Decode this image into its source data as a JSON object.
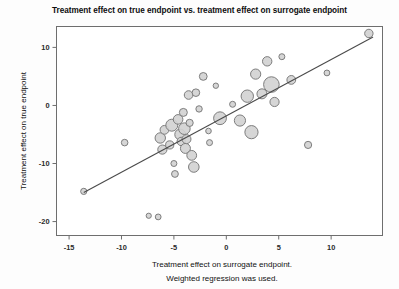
{
  "chart_data": {
    "type": "scatter",
    "title": "Treatment effect on true endpoint vs. treatment effect on surrogate endpoint",
    "xlabel": "Treatment effect on surrogate endpoint.",
    "xlabel_line2": "Weighted regression was used.",
    "ylabel": "Treatment effect on true endpoint",
    "xlim": [
      -16.2,
      14.9
    ],
    "ylim": [
      -22.4,
      13.6
    ],
    "xticks": [
      -15,
      -10,
      -5,
      0,
      5,
      10
    ],
    "xtick_labels": [
      "-15",
      "-10",
      "-5",
      "0",
      "5",
      "10"
    ],
    "yticks": [
      10,
      0,
      -10,
      -20
    ],
    "ytick_labels": [
      "10",
      "0",
      "-10",
      "-20"
    ],
    "grid": false,
    "legend": false,
    "marker": {
      "shape": "circle",
      "fill_color": "#d2d2d2",
      "edge_color": "#7d7d7d",
      "size_encodes": "study weight"
    },
    "regression_line": {
      "label": "Weighted regression line",
      "color": "#4a4a4a",
      "x_start": -13.6,
      "y_start": -15.0,
      "x_end": 14.0,
      "y_end": 11.8
    },
    "points": [
      {
        "x": -13.6,
        "y": -14.8,
        "w": 3.1
      },
      {
        "x": -9.7,
        "y": -6.4,
        "w": 3.3
      },
      {
        "x": -7.4,
        "y": -19.0,
        "w": 2.6
      },
      {
        "x": -6.5,
        "y": -19.2,
        "w": 2.9
      },
      {
        "x": -6.3,
        "y": -5.6,
        "w": 5.2
      },
      {
        "x": -6.1,
        "y": -7.6,
        "w": 4.6
      },
      {
        "x": -5.9,
        "y": -4.2,
        "w": 4.4
      },
      {
        "x": -5.4,
        "y": -6.8,
        "w": 4.1
      },
      {
        "x": -5.2,
        "y": -3.4,
        "w": 6.0
      },
      {
        "x": -5.0,
        "y": -10.0,
        "w": 3.0
      },
      {
        "x": -4.9,
        "y": -11.8,
        "w": 3.4
      },
      {
        "x": -4.6,
        "y": -2.4,
        "w": 4.8
      },
      {
        "x": -4.4,
        "y": -5.0,
        "w": 5.4
      },
      {
        "x": -4.3,
        "y": -6.2,
        "w": 4.2
      },
      {
        "x": -4.1,
        "y": -1.2,
        "w": 4.0
      },
      {
        "x": -4.0,
        "y": -4.0,
        "w": 5.8
      },
      {
        "x": -3.9,
        "y": -7.4,
        "w": 5.0
      },
      {
        "x": -3.8,
        "y": -5.8,
        "w": 4.5
      },
      {
        "x": -3.6,
        "y": 1.8,
        "w": 4.3
      },
      {
        "x": -3.5,
        "y": -3.0,
        "w": 3.6
      },
      {
        "x": -3.3,
        "y": -8.6,
        "w": 4.9
      },
      {
        "x": -3.1,
        "y": -10.6,
        "w": 5.3
      },
      {
        "x": -2.9,
        "y": 2.2,
        "w": 3.8
      },
      {
        "x": -2.6,
        "y": -0.6,
        "w": 3.2
      },
      {
        "x": -2.2,
        "y": 5.0,
        "w": 3.9
      },
      {
        "x": -1.7,
        "y": -4.4,
        "w": 2.8
      },
      {
        "x": -1.6,
        "y": -6.4,
        "w": 3.0
      },
      {
        "x": -1.0,
        "y": 3.4,
        "w": 2.7
      },
      {
        "x": -0.6,
        "y": -2.2,
        "w": 6.4
      },
      {
        "x": 0.6,
        "y": 0.2,
        "w": 3.0
      },
      {
        "x": 1.3,
        "y": -2.6,
        "w": 5.6
      },
      {
        "x": 2.0,
        "y": 1.6,
        "w": 6.2
      },
      {
        "x": 2.4,
        "y": -4.6,
        "w": 6.6
      },
      {
        "x": 2.8,
        "y": 5.4,
        "w": 5.1
      },
      {
        "x": 3.4,
        "y": 2.0,
        "w": 5.0
      },
      {
        "x": 3.9,
        "y": 7.6,
        "w": 4.7
      },
      {
        "x": 4.3,
        "y": 3.6,
        "w": 7.8
      },
      {
        "x": 4.6,
        "y": 0.6,
        "w": 4.6
      },
      {
        "x": 5.3,
        "y": 8.4,
        "w": 3.0
      },
      {
        "x": 6.2,
        "y": 4.4,
        "w": 4.4
      },
      {
        "x": 7.8,
        "y": -6.8,
        "w": 3.6
      },
      {
        "x": 9.6,
        "y": 5.6,
        "w": 2.9
      },
      {
        "x": 13.6,
        "y": 12.4,
        "w": 4.2
      }
    ]
  },
  "axes": {
    "frame_color": "#6e6e6e"
  }
}
